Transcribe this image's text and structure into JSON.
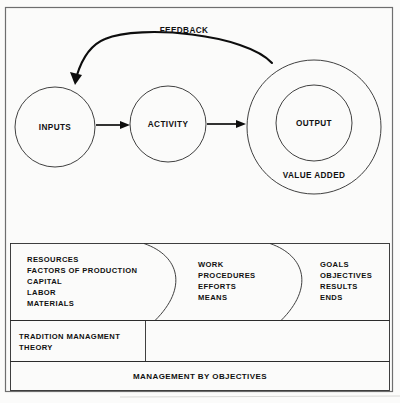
{
  "figure": {
    "background_color": "#fbfbfa",
    "line_color": "#1a1a1a",
    "frame_color": "#6e6e6e"
  },
  "flow": {
    "feedback_label": "FEEDBACK",
    "nodes": [
      {
        "id": "inputs",
        "label": "INPUTS"
      },
      {
        "id": "activity",
        "label": "ACTIVITY"
      },
      {
        "id": "output",
        "label": "OUTPUT"
      }
    ],
    "output_outer_label": "VALUE ADDED"
  },
  "columns": [
    {
      "id": "inputs-column",
      "lines": [
        "RESOURCES",
        "FACTORS OF PRODUCTION",
        "CAPITAL",
        "LABOR",
        "MATERIALS"
      ]
    },
    {
      "id": "activity-column",
      "lines": [
        "WORK",
        "PROCEDURES",
        "EFFORTS",
        "MEANS"
      ]
    },
    {
      "id": "output-column",
      "lines": [
        "GOALS",
        "OBJECTIVES",
        "RESULTS",
        "ENDS"
      ]
    }
  ],
  "middle_band": {
    "left_cell_lines": [
      "TRADITION MANAGMENT",
      "THEORY"
    ],
    "right_cell_lines": []
  },
  "bottom_band": {
    "label": "MANAGEMENT BY OBJECTIVES"
  }
}
